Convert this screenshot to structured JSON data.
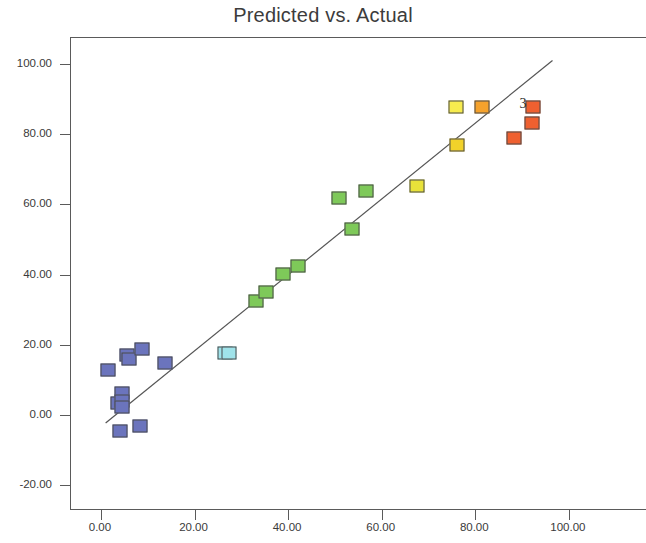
{
  "chart_data": {
    "type": "scatter",
    "title": "Predicted vs. Actual",
    "xlabel": "",
    "ylabel": "",
    "xlim": [
      -6.4,
      116.7
    ],
    "ylim": [
      -27.4,
      107.4
    ],
    "xticks": [
      0,
      20,
      40,
      60,
      80,
      100
    ],
    "xtick_labels": [
      "0.00",
      "20.00",
      "40.00",
      "60.00",
      "80.00",
      "100.00"
    ],
    "yticks": [
      -20,
      0,
      20,
      40,
      60,
      80,
      100
    ],
    "ytick_labels": [
      "-20.00",
      "0.00",
      "20.00",
      "40.00",
      "60.00",
      "80.00",
      "100.00"
    ],
    "grid": false,
    "legend": null,
    "fit_line": {
      "x0": 1.0,
      "y0": -2.3,
      "x1": 96.5,
      "y1": 101.0,
      "color": "#555555"
    },
    "marker_shape": "square",
    "points": [
      {
        "x": 1.5,
        "y": 12.8,
        "color": "#6b74bd",
        "label": null
      },
      {
        "x": 5.5,
        "y": 17.2,
        "color": "#6b74bd",
        "label": null
      },
      {
        "x": 6.0,
        "y": 15.9,
        "color": "#6b74bd",
        "label": null
      },
      {
        "x": 8.7,
        "y": 18.8,
        "color": "#6b74bd",
        "label": null
      },
      {
        "x": 13.7,
        "y": 14.8,
        "color": "#6b74bd",
        "label": null
      },
      {
        "x": 4.6,
        "y": 6.3,
        "color": "#6b74bd",
        "label": null
      },
      {
        "x": 3.7,
        "y": 3.5,
        "color": "#6b74bd",
        "label": null
      },
      {
        "x": 4.6,
        "y": 4.0,
        "color": "#6b74bd",
        "label": null
      },
      {
        "x": 4.4,
        "y": 2.1,
        "color": "#6b74bd",
        "label": null
      },
      {
        "x": 4.0,
        "y": -4.6,
        "color": "#6b74bd",
        "label": null
      },
      {
        "x": 8.4,
        "y": -3.1,
        "color": "#6b74bd",
        "label": null
      },
      {
        "x": 26.6,
        "y": 17.6,
        "color": "#9fe3ea",
        "label": null
      },
      {
        "x": 27.3,
        "y": 17.5,
        "color": "#9fe3ea",
        "label": null
      },
      {
        "x": 33.2,
        "y": 32.4,
        "color": "#7ec959",
        "label": null
      },
      {
        "x": 35.3,
        "y": 34.9,
        "color": "#7ec959",
        "label": null
      },
      {
        "x": 38.9,
        "y": 40.2,
        "color": "#7ec959",
        "label": null
      },
      {
        "x": 42.2,
        "y": 42.3,
        "color": "#7ec959",
        "label": null
      },
      {
        "x": 50.8,
        "y": 61.9,
        "color": "#7ec959",
        "label": null
      },
      {
        "x": 56.6,
        "y": 63.9,
        "color": "#7ec959",
        "label": null
      },
      {
        "x": 53.6,
        "y": 53.0,
        "color": "#7ec959",
        "label": null
      },
      {
        "x": 67.6,
        "y": 65.2,
        "color": "#e8e23a",
        "label": null
      },
      {
        "x": 76.0,
        "y": 76.8,
        "color": "#f2d22a",
        "label": null
      },
      {
        "x": 75.9,
        "y": 87.8,
        "color": "#f7ec4e",
        "label": null
      },
      {
        "x": 81.4,
        "y": 87.8,
        "color": "#f5a22c",
        "label": null
      },
      {
        "x": 92.3,
        "y": 87.8,
        "color": "#ef6030",
        "label": "3"
      },
      {
        "x": 92.1,
        "y": 83.3,
        "color": "#ef6030",
        "label": null
      },
      {
        "x": 88.2,
        "y": 78.8,
        "color": "#ef6030",
        "label": null
      }
    ],
    "annotations": [
      {
        "text": "3",
        "x": 90.2,
        "y": 88.5
      }
    ]
  }
}
